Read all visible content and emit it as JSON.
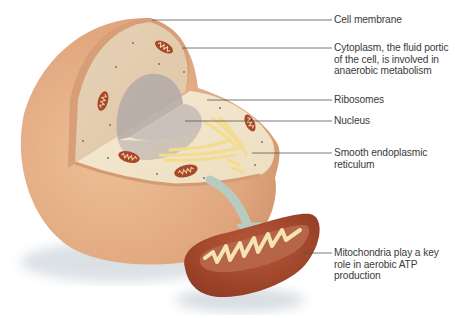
{
  "diagram": {
    "type": "labeled-illustration",
    "labels": [
      {
        "id": "cell-membrane",
        "text": "Cell membrane",
        "y": 20,
        "x_start": 152
      },
      {
        "id": "cytoplasm",
        "text": "Cytoplasm, the fluid portic\nof the cell, is involved in\nanaerobic metabolism",
        "y": 48,
        "x_start": 182
      },
      {
        "id": "ribosomes",
        "text": "Ribosomes",
        "y": 100,
        "x_start": 207
      },
      {
        "id": "nucleus",
        "text": "Nucleus",
        "y": 121,
        "x_start": 185
      },
      {
        "id": "smooth-er",
        "text": "Smooth endoplasmic\nreticulum",
        "y": 153,
        "x_start": 252
      },
      {
        "id": "mitochondria",
        "text": "Mitochondria play a key\nrole in aerobic ATP\nproduction",
        "y": 253,
        "x_start": 302
      }
    ],
    "leader_line_end_x": 332,
    "colors": {
      "membrane": "#dca57e",
      "cell_outer": "#e2aa82",
      "cytoplasm": "#e9d7be",
      "cut_face": "#f1e6cc",
      "nucleus": "#b9afab",
      "mitochondrion": "#a8472a",
      "cristae": "#f6e3b5",
      "er": "#f3dc8e",
      "arrow": "#b8cbc0",
      "leader": "#555555",
      "text": "#3a3a3a"
    }
  }
}
